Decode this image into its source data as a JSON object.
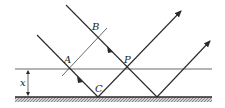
{
  "diagram": {
    "labels": {
      "A": "A",
      "B": "B",
      "C": "C",
      "P": "P",
      "x": "x"
    },
    "colors": {
      "stroke": "#2a2a2a",
      "ground": "#8a8a8a",
      "background": "#ffffff"
    }
  }
}
